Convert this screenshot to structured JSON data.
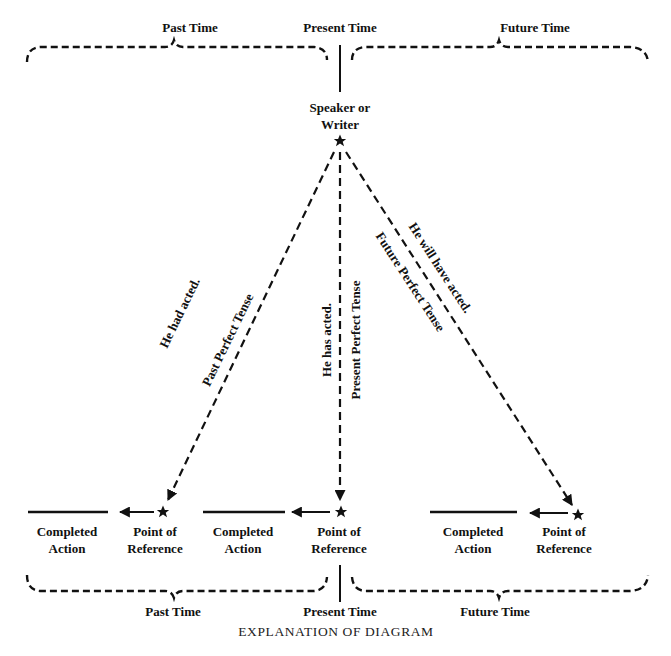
{
  "top": {
    "past_label": "Past Time",
    "present_label": "Present Time",
    "future_label": "Future Time"
  },
  "speaker": {
    "line1": "Speaker or",
    "line2": "Writer"
  },
  "tenses": {
    "past": {
      "example": "He had acted.",
      "name": "Past Perfect Tense"
    },
    "present": {
      "example": "He has acted.",
      "name": "Present Perfect Tense"
    },
    "future": {
      "example": "He will have acted.",
      "name": "Future Perfect Tense"
    }
  },
  "bottom_row": {
    "groups": [
      {
        "completed_line1": "Completed",
        "completed_line2": "Action",
        "ref_line1": "Point of",
        "ref_line2": "Reference"
      },
      {
        "completed_line1": "Completed",
        "completed_line2": "Action",
        "ref_line1": "Point of",
        "ref_line2": "Reference"
      },
      {
        "completed_line1": "Completed",
        "completed_line2": "Action",
        "ref_line1": "Point of",
        "ref_line2": "Reference"
      }
    ]
  },
  "bottom": {
    "past_label": "Past Time",
    "present_label": "Present Time",
    "future_label": "Future Time"
  },
  "caption": "EXPLANATION OF DIAGRAM",
  "colors": {
    "ink": "#111111",
    "background": "#ffffff"
  }
}
